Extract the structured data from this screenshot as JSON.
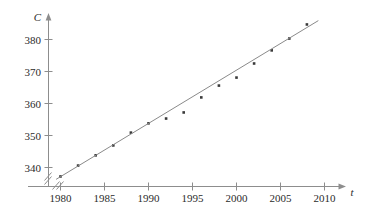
{
  "chart_data": {
    "type": "scatter",
    "title": "",
    "subtitle": "",
    "xlabel": "t",
    "ylabel": "C",
    "xlim": [
      1978.5,
      2011
    ],
    "ylim": [
      334.5,
      387
    ],
    "grid": false,
    "legend": null,
    "x_ticks": [
      1980,
      1985,
      1990,
      1995,
      2000,
      2005,
      2010
    ],
    "x_tick_labels": [
      "1980",
      "1985",
      "1990",
      "1995",
      "2000",
      "2005",
      "2010"
    ],
    "y_ticks": [
      340,
      350,
      360,
      370,
      380
    ],
    "y_tick_labels": [
      "340",
      "350",
      "360",
      "370",
      "380"
    ],
    "axis_break_x": true,
    "axis_break_y": true,
    "x": [
      1980,
      1982,
      1984,
      1986,
      1988,
      1990,
      1992,
      1994,
      1996,
      1998,
      2000,
      2002,
      2004,
      2006,
      2008
    ],
    "values": [
      337.2,
      340.6,
      343.8,
      346.9,
      350.9,
      353.8,
      355.3,
      357.2,
      361.9,
      365.6,
      368.1,
      372.5,
      376.6,
      380.3,
      384.7
    ],
    "series": [
      {
        "name": "observed",
        "type": "scatter",
        "x": [
          1980,
          1982,
          1984,
          1986,
          1988,
          1990,
          1992,
          1994,
          1996,
          1998,
          2000,
          2002,
          2004,
          2006,
          2008
        ],
        "values": [
          337.2,
          340.6,
          343.8,
          346.9,
          350.9,
          353.8,
          355.3,
          357.2,
          361.9,
          365.6,
          368.1,
          372.5,
          376.6,
          380.3,
          384.7
        ]
      },
      {
        "name": "regression-line",
        "type": "line",
        "x": [
          1979.5,
          2009.3
        ],
        "values": [
          336.3,
          385.9
        ]
      }
    ],
    "annotations": [],
    "colors": {
      "point": "#3a3a3a",
      "line": "#8a8a8a",
      "axis": "#8d8d8d",
      "text": "#2b2b2b",
      "background": "#ffffff"
    }
  },
  "axes": {
    "y_axis_name": "C",
    "x_axis_name": "t"
  }
}
